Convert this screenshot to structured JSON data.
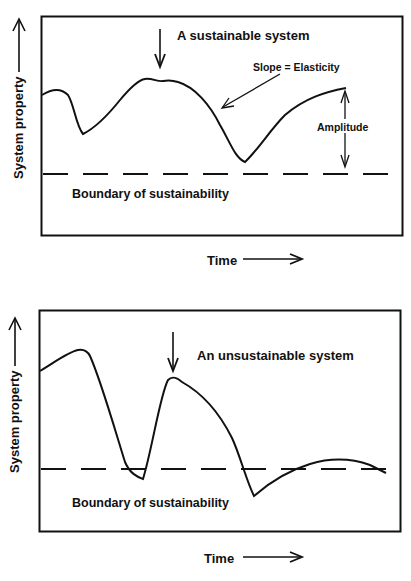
{
  "colors": {
    "ink": "#111111",
    "background": "#ffffff"
  },
  "panels": [
    {
      "id": "sustainable",
      "title": "A sustainable system",
      "slope_label": "Slope = Elasticity",
      "amplitude_label": "Amplitude",
      "boundary_label": "Boundary of sustainability",
      "y_axis_label": "System property",
      "x_axis_label": "Time"
    },
    {
      "id": "unsustainable",
      "title": "An unsustainable system",
      "boundary_label": "Boundary of sustainability",
      "y_axis_label": "System property",
      "x_axis_label": "Time"
    }
  ],
  "icons": {
    "disturbance_arrow": "down-arrow-icon",
    "axis_arrow_up": "up-arrow-icon",
    "axis_arrow_right": "right-arrow-icon",
    "amplitude_arrow": "double-headed-arrow-icon",
    "slope_pointer": "diagonal-arrow-icon"
  }
}
